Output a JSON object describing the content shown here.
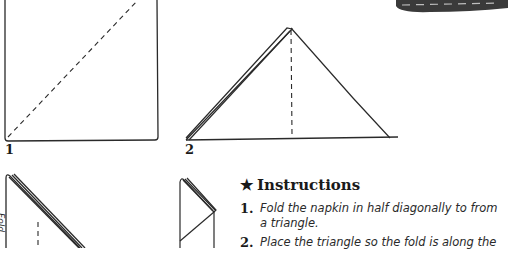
{
  "figures": [
    {
      "label": "1",
      "description": "square napkin with dashed diagonal fold line"
    },
    {
      "label": "2",
      "description": "triangle with dashed vertical center fold line"
    },
    {
      "label": "",
      "description": "folded triangle with dashed fold line, partially visible"
    },
    {
      "label": "",
      "description": "narrow folded shape, partially visible"
    }
  ],
  "side_text": "Fold",
  "instructions": {
    "star": "★",
    "heading": "Instructions",
    "steps": [
      {
        "num": "1.",
        "text": "Fold the napkin in half diagonally to from a triangle."
      },
      {
        "num": "2.",
        "text": "Place the triangle so the fold is along the"
      }
    ]
  }
}
